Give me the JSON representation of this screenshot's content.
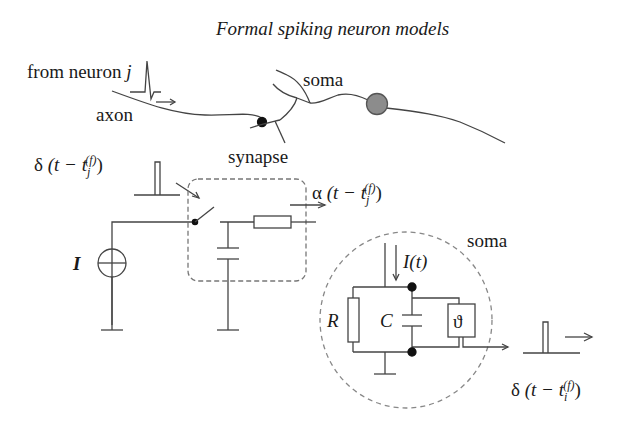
{
  "title": "Formal spiking neuron models",
  "labels": {
    "from_neuron_prefix": "from neuron ",
    "from_neuron_index": "j",
    "axon": "axon",
    "soma_top": "soma",
    "synapse": "synapse",
    "soma_circuit": "soma",
    "current_source": "I",
    "input_current": "I(t)",
    "resistor": "R",
    "capacitor": "C",
    "threshold": "ϑ"
  },
  "formulas": {
    "input_spike": {
      "fn": "δ",
      "open": " (t − t",
      "sub": "j",
      "sup": "(f)",
      "close": ")"
    },
    "synaptic_kernel": {
      "fn": "α",
      "open": " (t − t",
      "sub": "j",
      "sup": "(f)",
      "close": ")"
    },
    "output_spike": {
      "fn": "δ",
      "open": " (t − t",
      "sub": "i",
      "sup": "(f)",
      "close": ")"
    }
  },
  "colors": {
    "line": "#444444",
    "soma_fill": "#8c8c8c",
    "dashed": "#777777",
    "text": "#1a1a1a"
  }
}
